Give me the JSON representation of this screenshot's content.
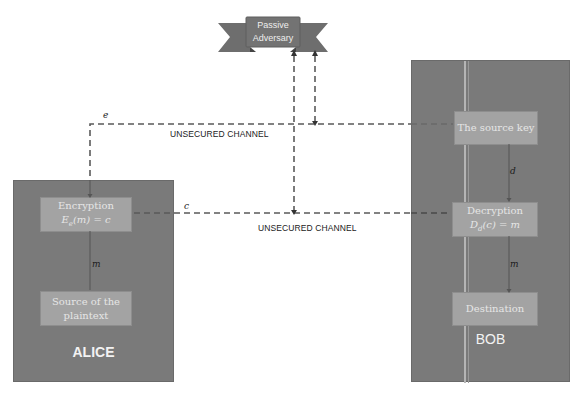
{
  "adversary": {
    "label_line1": "Passive",
    "label_line2": "Adversary"
  },
  "channels": {
    "top_label": "UNSECURED CHANNEL",
    "bottom_label": "UNSECURED CHANNEL"
  },
  "variables": {
    "e": "e",
    "c": "c",
    "d": "d",
    "m_alice": "m",
    "m_bob": "m"
  },
  "alice": {
    "name": "ALICE",
    "encryption": {
      "title": "Encryption",
      "formula": "Eₑ(m) = c"
    },
    "source": {
      "line1": "Source of the",
      "line2": "plaintext"
    }
  },
  "bob": {
    "name": "BOB",
    "source_key": "The source key",
    "decryption": {
      "title": "Decryption",
      "formula": "Dₐ(c) = m"
    },
    "destination": "Destination"
  },
  "colors": {
    "party_fill": "#7a7a7a",
    "inner_fill": "#a3a3a3",
    "banner_fill": "#6e6e6e",
    "dash": "#5a5a5a"
  }
}
